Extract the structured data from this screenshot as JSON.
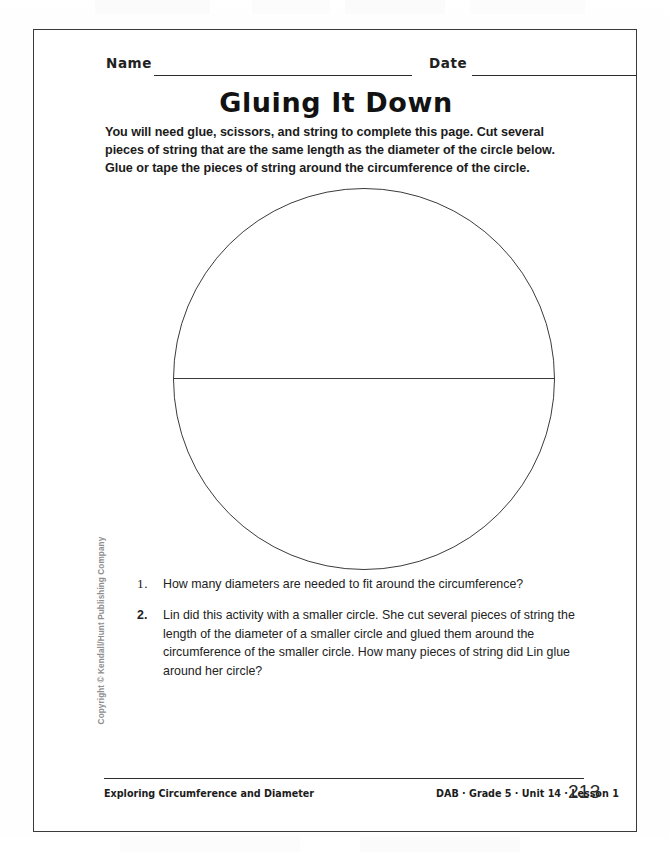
{
  "page": {
    "title": "Gluing It Down",
    "background_color": "#ffffff",
    "border_color": "#3a3a3a"
  },
  "header": {
    "name_label": "Name",
    "date_label": "Date"
  },
  "intro": {
    "text": "You will need glue, scissors, and string to complete this page. Cut several pieces of string that are the same length as the diameter of the circle below. Glue or tape the pieces of string around the circumference of the circle."
  },
  "figure": {
    "shape": "circle",
    "has_diameter_line": true,
    "stroke_color": "#3b3b3b"
  },
  "questions": [
    {
      "number": "1.",
      "text": "How many diameters are needed to fit around the circumference?"
    },
    {
      "number": "2.",
      "text": "Lin did this activity with a smaller circle. She cut several pieces of string the length of the diameter of a smaller circle and glued them around the circumference of the smaller circle. How many pieces of string did Lin glue around her circle?"
    }
  ],
  "copyright": {
    "text": "Copyright © Kendall/Hunt Publishing Company"
  },
  "footer": {
    "lesson_title": "Exploring Circumference and Diameter",
    "meta": "DAB · Grade 5 · Unit 14 · Lesson 1",
    "page_number": "213"
  }
}
